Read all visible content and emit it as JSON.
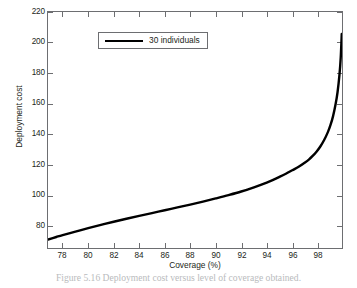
{
  "chart_data": {
    "type": "line",
    "title": "",
    "xlabel": "Coverage (%)",
    "ylabel": "Deployment cost",
    "xlim": [
      76.85,
      99.9
    ],
    "ylim": [
      70,
      220
    ],
    "xticks": [
      78,
      80,
      82,
      84,
      86,
      88,
      90,
      92,
      94,
      96,
      98
    ],
    "yticks": [
      80,
      100,
      120,
      140,
      160,
      180,
      200,
      220
    ],
    "grid": false,
    "legend_position": "upper left",
    "series": [
      {
        "name": "30 individuals",
        "color": "#000000",
        "linewidth": 2.2,
        "x": [
          76.85,
          77.5,
          78,
          79,
          80,
          81,
          82,
          83,
          84,
          85,
          86,
          87,
          88,
          89,
          90,
          91,
          92,
          93,
          94,
          94.5,
          95,
          95.5,
          96,
          96.5,
          97,
          97.3,
          97.6,
          97.9,
          98.2,
          98.5,
          98.8,
          99.0,
          99.2,
          99.4,
          99.55,
          99.7,
          99.8,
          99.88
        ],
        "y": [
          75.4,
          77.0,
          78.2,
          80.4,
          82.6,
          84.7,
          86.7,
          88.6,
          90.4,
          92.2,
          94.0,
          95.8,
          97.6,
          99.5,
          101.5,
          103.6,
          105.9,
          108.6,
          111.6,
          113.3,
          115.2,
          117.2,
          119.4,
          121.6,
          124.3,
          126.2,
          128.5,
          131.2,
          134.5,
          138.6,
          143.8,
          148.2,
          153.8,
          161.5,
          169.0,
          180.0,
          191.0,
          206.0
        ]
      }
    ]
  },
  "legend": {
    "entries": [
      {
        "label": "30 individuals"
      }
    ]
  },
  "caption": {
    "text": "Figure 5.16   Deployment cost versus level of coverage obtained."
  }
}
